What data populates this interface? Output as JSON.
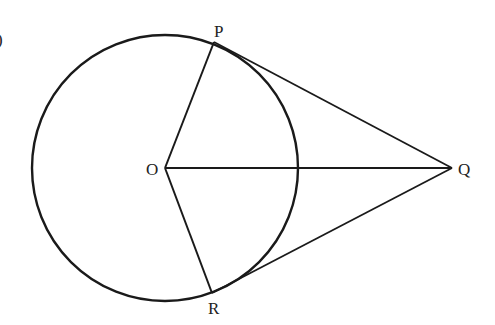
{
  "figure": {
    "type": "geometry",
    "stroke_color": "#1a1a1a",
    "circle": {
      "center_label": "O",
      "cx": 165,
      "cy": 168,
      "r": 133
    },
    "points": {
      "O": {
        "label": "O",
        "x": 165,
        "y": 168
      },
      "P": {
        "label": "P",
        "x": 214,
        "y": 42
      },
      "Q": {
        "label": "Q",
        "x": 452,
        "y": 168
      },
      "R": {
        "label": "R",
        "x": 212,
        "y": 293
      }
    },
    "segments": [
      "OP",
      "OR",
      "OQ",
      "PQ",
      "RQ"
    ],
    "margin_mark": ")"
  }
}
